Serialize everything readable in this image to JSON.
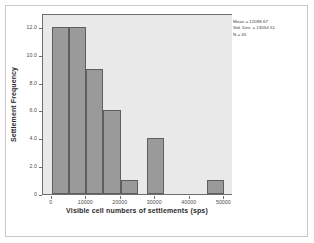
{
  "chart_data": {
    "type": "bar",
    "title": "",
    "subtitle": "",
    "xlabel": "Visible cell numbers of settlements (sps)",
    "ylabel": "Settlement Frequency",
    "xlim": [
      -2500,
      52500
    ],
    "ylim": [
      0,
      13
    ],
    "grid": false,
    "legend_position": "none",
    "bin_width": 5000,
    "xticks": [
      0,
      10000,
      20000,
      30000,
      40000,
      50000
    ],
    "xtick_labels": [
      "0",
      "10000",
      "20000",
      "30000",
      "40000",
      "50000"
    ],
    "yticks": [
      0,
      2,
      4,
      6,
      8,
      10,
      12
    ],
    "ytick_labels": [
      "0",
      "2.0",
      "4.0",
      "6.0",
      "8.0",
      "10.0",
      "12.0"
    ],
    "bars": [
      {
        "bin_start": 0,
        "bin_end": 5000,
        "value": 12
      },
      {
        "bin_start": 5000,
        "bin_end": 10000,
        "value": 12
      },
      {
        "bin_start": 10000,
        "bin_end": 15000,
        "value": 9
      },
      {
        "bin_start": 15000,
        "bin_end": 20000,
        "value": 6
      },
      {
        "bin_start": 20000,
        "bin_end": 25000,
        "value": 1
      },
      {
        "bin_start": 27500,
        "bin_end": 32500,
        "value": 4
      },
      {
        "bin_start": 45000,
        "bin_end": 50000,
        "value": 1
      }
    ],
    "categories": [
      "0-5000",
      "5000-10000",
      "10000-15000",
      "15000-20000",
      "20000-25000",
      "27500-32500",
      "45000-50000"
    ],
    "values": [
      12,
      12,
      9,
      6,
      1,
      4,
      1
    ],
    "colors": {
      "bar_fill": "#9a9a9a",
      "bar_edge": "#5e5e5e",
      "plot_background": "#e9e9e9",
      "axis": "#6e6e6e",
      "page_background": "#ffffff",
      "frame": "#c9c9c9"
    }
  },
  "annotations": {
    "stats": [
      "Mean = 12098.67",
      "Std. Dev. = 13054.51",
      "N = 45"
    ]
  }
}
